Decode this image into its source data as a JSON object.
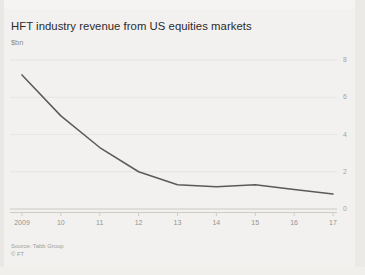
{
  "figure": {
    "title": "HFT industry revenue from US equities markets",
    "subtitle": "$bn",
    "background_color": "#f2f1ef",
    "line_color": "#5a5a5a",
    "grid_color": "#e4e3e0",
    "axis_color": "#c9c7c3",
    "tick_label_color": "#a6a4a0",
    "title_color": "#2b2b2b"
  },
  "footer": {
    "source": "Source: Tabb Group",
    "copyright": "© FT"
  },
  "chart_data": {
    "type": "line",
    "title": "HFT industry revenue from US equities markets",
    "subtitle": "$bn",
    "xlabel": "",
    "ylabel": "$bn",
    "x": [
      2009,
      2010,
      2011,
      2012,
      2013,
      2014,
      2015,
      2016,
      2017
    ],
    "categories": [
      "2009",
      "10",
      "11",
      "12",
      "13",
      "14",
      "15",
      "16",
      "17"
    ],
    "values": [
      7.2,
      5.0,
      3.3,
      2.0,
      1.3,
      1.2,
      1.3,
      1.05,
      0.8
    ],
    "series": [
      {
        "name": "HFT industry revenue",
        "values": [
          7.2,
          5.0,
          3.3,
          2.0,
          1.3,
          1.2,
          1.3,
          1.05,
          0.8
        ]
      }
    ],
    "ylim": [
      0,
      8
    ],
    "yticks": [
      0,
      2,
      4,
      6,
      8
    ],
    "ytick_labels": [
      "0",
      "2",
      "4",
      "6",
      "8"
    ],
    "xtick_labels": [
      "2009",
      "10",
      "11",
      "12",
      "13",
      "14",
      "15",
      "16",
      "17"
    ],
    "y_axis_position": "right",
    "grid": "horizontal",
    "legend": "none",
    "annotations": []
  }
}
